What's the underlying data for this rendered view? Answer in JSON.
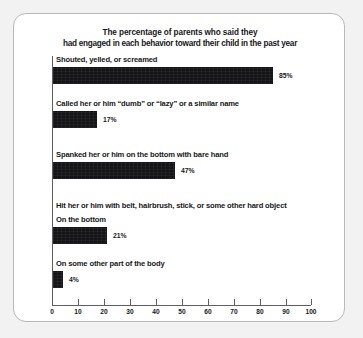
{
  "figure": {
    "title_line1": "The percentage of parents who said they",
    "title_line2": "had engaged in each behavior toward their child in the past year",
    "group4_header": "Hit her or him with belt, hairbrush, stick, or some other hard object"
  },
  "chart_data": {
    "type": "bar",
    "orientation": "horizontal",
    "title": "The percentage of parents who said they had engaged in each behavior toward their child in the past year",
    "xlabel": "",
    "ylabel": "",
    "xlim": [
      0,
      100
    ],
    "grid": false,
    "legend": null,
    "xticks": [
      "0",
      "10",
      "20",
      "30",
      "40",
      "50",
      "60",
      "70",
      "80",
      "90",
      "100"
    ],
    "categories": [
      "Shouted, yelled, or screamed",
      "Called her or him “dumb” or “lazy” or a similar name",
      "Spanked her or him on the bottom with bare hand",
      "On the bottom",
      "On some other part of the body"
    ],
    "values": [
      85,
      17,
      47,
      21,
      4
    ],
    "value_labels": [
      "85%",
      "17%",
      "47%",
      "21%",
      "4%"
    ],
    "group_headers": [
      null,
      null,
      null,
      "Hit her or him with belt, hairbrush, stick, or some other hard object",
      null
    ],
    "bar_color": "#141416"
  }
}
